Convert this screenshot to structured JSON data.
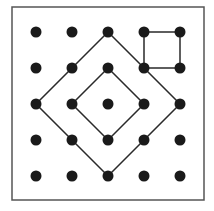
{
  "diagram": {
    "type": "geoboard",
    "grid": {
      "rows": 5,
      "cols": 5,
      "origin_x": 36,
      "origin_y": 32,
      "spacing": 36,
      "dot_radius": 5.5
    },
    "frame": {
      "x": 12,
      "y": 7,
      "width": 192,
      "height": 193
    },
    "colors": {
      "background": "#ffffff",
      "dot": "#1a1a1a",
      "line": "#2a2a2a",
      "frame": "#555555"
    },
    "shapes": [
      {
        "name": "outer-diamond",
        "points": [
          [
            2,
            0
          ],
          [
            4,
            2
          ],
          [
            2,
            4
          ],
          [
            0,
            2
          ]
        ]
      },
      {
        "name": "inner-diamond",
        "points": [
          [
            2,
            1
          ],
          [
            3,
            2
          ],
          [
            2,
            3
          ],
          [
            1,
            2
          ]
        ]
      },
      {
        "name": "small-square",
        "points": [
          [
            3,
            0
          ],
          [
            4,
            0
          ],
          [
            4,
            1
          ],
          [
            3,
            1
          ]
        ]
      }
    ]
  }
}
